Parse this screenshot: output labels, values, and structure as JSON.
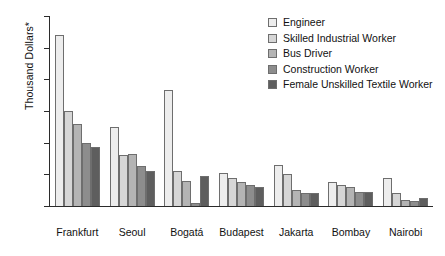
{
  "chart_data": {
    "type": "bar",
    "title": "",
    "xlabel": "",
    "ylabel": "Thousand Dollars*",
    "ylim": [
      0,
      60
    ],
    "yticks": [
      0,
      10,
      20,
      30,
      40,
      50,
      60
    ],
    "grid": false,
    "legend_position": "top-right",
    "categories": [
      "Frankfurt",
      "Seoul",
      "Bogatá",
      "Budapest",
      "Jakarta",
      "Bombay",
      "Nairobi"
    ],
    "series": [
      {
        "name": "Engineer",
        "color": "#ededed",
        "values": [
          54,
          25,
          36.5,
          10.5,
          13,
          7.5,
          9
        ]
      },
      {
        "name": "Skilled Industrial Worker",
        "color": "#d6d6d6",
        "values": [
          30,
          16,
          11,
          9,
          10,
          6.5,
          4
        ]
      },
      {
        "name": "Bus Driver",
        "color": "#b4b4b4",
        "values": [
          26,
          16.5,
          8,
          7.5,
          5,
          6,
          2
        ]
      },
      {
        "name": "Construction Worker",
        "color": "#8d8d8d",
        "values": [
          20,
          12.5,
          1,
          6.5,
          4,
          4.5,
          1.5
        ]
      },
      {
        "name": "Female Unskilled Textile Worker",
        "color": "#5e5e5e",
        "values": [
          18.5,
          11,
          9.5,
          6,
          4,
          4.5,
          2.5
        ]
      }
    ]
  },
  "axis": {
    "y_label": "Thousand Dollars*"
  }
}
